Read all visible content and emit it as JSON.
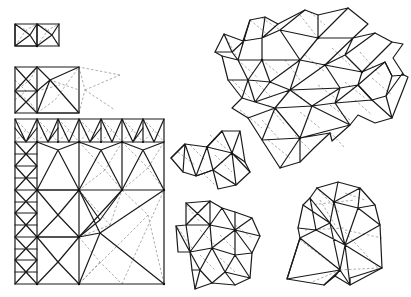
{
  "diagram": {
    "colors": {
      "background": "#ffffff",
      "edge": "#1a1a1a",
      "hidden_edge": "#8a8a8a"
    },
    "meshes": [
      {
        "id": "small-rect-2cell",
        "bbox": [
          15,
          24,
          59,
          46
        ]
      },
      {
        "id": "rect-refined",
        "bbox": [
          15,
          67,
          79,
          113
        ]
      },
      {
        "id": "large-square-quadtree",
        "bbox": [
          15,
          119,
          164,
          284
        ]
      },
      {
        "id": "cluster-large-top-right",
        "bbox": [
          215,
          8,
          404,
          168
        ]
      },
      {
        "id": "cluster-small-middle",
        "bbox": [
          171,
          131,
          252,
          189
        ]
      },
      {
        "id": "cluster-bottom-middle",
        "bbox": [
          176,
          199,
          260,
          289
        ]
      },
      {
        "id": "cluster-bottom-right",
        "bbox": [
          287,
          183,
          385,
          285
        ]
      }
    ]
  }
}
